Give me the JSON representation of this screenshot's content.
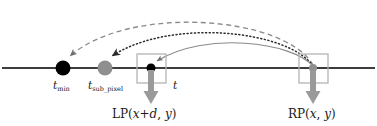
{
  "figure": {
    "name": "subpixel-disparity-timeline-diagram",
    "width": 377,
    "height": 126,
    "background": "#ffffff"
  },
  "colors": {
    "axis_line": "#3d3d3d",
    "dot_black": "#000000",
    "dot_gray": "#8f8f8f",
    "curve_dashed": "#8a8a8a",
    "curve_dotted": "#2b2b2b",
    "curve_solid": "#8a8a8a",
    "box_stroke": "#b4b4b4",
    "down_arrow": "#9a9a9a",
    "text": "#1a1a1a"
  },
  "axis": {
    "label": "timeline-axis",
    "y": 68,
    "x_start": 2,
    "x_end": 375
  },
  "points": [
    {
      "name": "t-min-point",
      "x": 63,
      "y": 68,
      "radius": 7.5,
      "fill": "#000000",
      "label": "t",
      "subscript": "min",
      "subscript_italic": false
    },
    {
      "name": "t-sub-pixel-point",
      "x": 105,
      "y": 68,
      "radius": 7.5,
      "fill": "#8f8f8f",
      "label": "t",
      "subscript": "sub_pixel",
      "subscript_italic": false
    },
    {
      "name": "lp-point",
      "x": 151,
      "y": 68,
      "radius": 4.5,
      "fill": "#000000",
      "label": "t",
      "subscript": "",
      "subscript_italic": false
    },
    {
      "name": "rp-point",
      "x": 313,
      "y": 68,
      "radius": 4.0,
      "fill": "#8f8f8f",
      "label": "",
      "subscript": "",
      "subscript_italic": false
    }
  ],
  "boxes": [
    {
      "name": "lp-box",
      "x": 137,
      "y": 54,
      "width": 29,
      "height": 29
    },
    {
      "name": "rp-box",
      "x": 299,
      "y": 54,
      "width": 29,
      "height": 29
    }
  ],
  "down_arrows": [
    {
      "name": "lp-down-arrow",
      "x": 151,
      "y_start": 70,
      "y_end": 103
    },
    {
      "name": "rp-down-arrow",
      "x": 313,
      "y_start": 70,
      "y_end": 103
    }
  ],
  "curves": [
    {
      "name": "dashed-curve-to-tmin",
      "style": "dashed",
      "from_x": 313,
      "from_y": 66,
      "to_x": 68,
      "to_y": 58,
      "apex_y": 10,
      "color": "#8a8a8a"
    },
    {
      "name": "dotted-curve-to-tsubpixel",
      "style": "dotted",
      "from_x": 313,
      "from_y": 66,
      "to_x": 110,
      "to_y": 58,
      "apex_y": 22,
      "color": "#2b2b2b"
    },
    {
      "name": "solid-curve-to-t",
      "style": "solid",
      "from_x": 313,
      "from_y": 66,
      "to_x": 155,
      "to_y": 62,
      "apex_y": 35,
      "color": "#8a8a8a"
    }
  ],
  "labels": {
    "t_min": {
      "base": "t",
      "subscript": "min"
    },
    "t_sub_pixel": {
      "base": "t",
      "subscript": "sub_pixel"
    },
    "t": {
      "base": "t"
    },
    "lp": {
      "prefix": "LP(",
      "var1": "x",
      "plus": "+",
      "var2": "d",
      "comma": ", ",
      "var3": "y",
      "suffix": ")"
    },
    "rp": {
      "prefix": "RP(",
      "var1": "x",
      "comma": ", ",
      "var2": "y",
      "suffix": ")"
    }
  }
}
